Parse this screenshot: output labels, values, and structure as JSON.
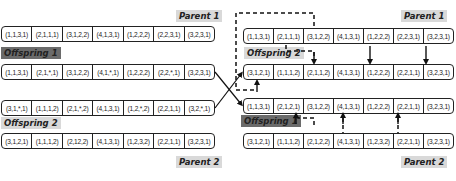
{
  "left": {
    "parent1": {
      "label": "Parent 1",
      "genes": [
        "(1,1,3,1)",
        "(2,1,1,1)",
        "(3,1,2,2)",
        "(4,1,3,1)",
        "(1,2,2,2)",
        "(2,2,3,1)",
        "(3,2,3,1)"
      ]
    },
    "offspring1": {
      "label": "Offspring 1",
      "genes": [
        "(1,1,3,1)",
        "(2,1,*,1)",
        "(3,1,2,2)",
        "(4,1,*,1)",
        "(1,2,2,2)",
        "(2,2,*,1)",
        "(3,2,3,1)"
      ]
    },
    "offspring2": {
      "label": "Offspring 2",
      "genes": [
        "(3,1,*,1)",
        "(1,1,1,2)",
        "(2,1,*,2)",
        "(4,1,3,1)",
        "(1,2,*,2)",
        "(2,2,1,1)",
        "(3,2,*,1)"
      ]
    },
    "parent2": {
      "label": "Parent 2",
      "genes": [
        "(3,1,2,1)",
        "(1,1,1,2)",
        "(2,12,2)",
        "(4,1,3,1)",
        "(1,2,3,2)",
        "(2,2,1,1)",
        "(3,2,3,1)"
      ]
    }
  },
  "right": {
    "parent1": {
      "label": "Parent 1",
      "genes": [
        "(1,1,3,1)",
        "(2,1,1,1)",
        "(3,1,2,2)",
        "(4,1,3,1)",
        "(1,2,2,2)",
        "(2,2,3,1)",
        "(3,2,3,1)"
      ]
    },
    "offspring2": {
      "label": "Offspring 2",
      "genes": [
        "(3,1,2,1)",
        "(1,1,1,2)",
        "(2,1,1,2)",
        "(4,1,3,1)",
        "(1,2,2,2)",
        "(2,2,1,1)",
        "(3,2,3,1)"
      ]
    },
    "offspring1": {
      "label": "Offspring 1",
      "genes": [
        "(1,1,3,1)",
        "(2,1,2,1)",
        "(3,1,2,2)",
        "(4,1,3,1)",
        "(1,2,2,2)",
        "(2,2,1,1)",
        "(3,2,3,1)"
      ]
    },
    "parent2": {
      "label": "Parent 2",
      "genes": [
        "(3,1,2,1)",
        "(1,1,1,2)",
        "(2,1,2,2)",
        "(4,1,3,1)",
        "(1,2,3,2)",
        "(2,2,1,1)",
        "(3,2,3,1)"
      ]
    }
  },
  "colors": {
    "light_label_bg": "#d9d9d9",
    "dark_label_bg": "#6b6b6b",
    "line": "#222222"
  }
}
